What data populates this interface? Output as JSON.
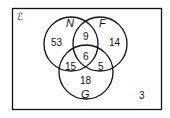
{
  "diagram": {
    "type": "venn",
    "universal_symbol": "ℰ",
    "sets": [
      {
        "name": "N"
      },
      {
        "name": "F"
      },
      {
        "name": "G"
      }
    ],
    "regions": {
      "N_only": "53",
      "F_only": "14",
      "G_only": "18",
      "N_F_only": "9",
      "N_G_only": "15",
      "F_G_only": "5",
      "N_F_G": "6",
      "outside": "3"
    }
  }
}
